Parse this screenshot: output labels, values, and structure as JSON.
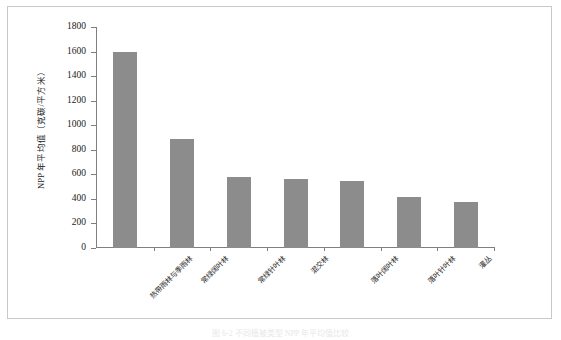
{
  "figure": {
    "caption": "图 6-2  不同植被类型 NPP 年平均值比较",
    "frame_color": "#c9c9c9",
    "background": "#ffffff"
  },
  "chart_data": {
    "type": "bar",
    "title": "",
    "xlabel": "",
    "ylabel": "NPP 年平均值（克碳/平方米）",
    "ylim": [
      0,
      1800
    ],
    "ytick_step": 200,
    "yticks": [
      1800,
      1600,
      1400,
      1200,
      1000,
      800,
      600,
      400,
      200,
      0
    ],
    "ytick_labels": [
      "1800",
      "1600",
      "1400",
      "1200",
      "1000",
      "800",
      "600",
      "400",
      "200",
      "0"
    ],
    "grid": false,
    "legend": false,
    "bar_color": "#8c8c8c",
    "axis_color": "#7f7f7f",
    "categories": [
      "热带雨林与季雨林",
      "常绿阔叶林",
      "常绿针叶林",
      "混交林",
      "落叶阔叶林",
      "落叶针叶林",
      "灌丛"
    ],
    "values": [
      1600,
      890,
      575,
      565,
      548,
      415,
      372
    ]
  }
}
